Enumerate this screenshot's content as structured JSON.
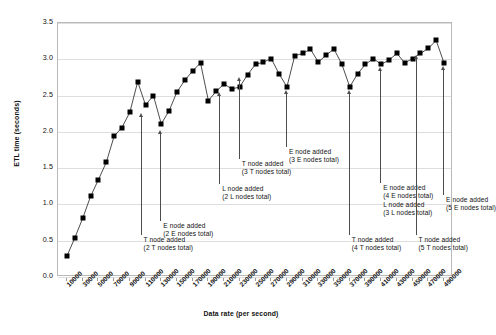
{
  "chart_data": {
    "type": "line",
    "title": "",
    "xlabel": "Data rate (per second)",
    "ylabel": "ETL time (seconds)",
    "ylim": [
      0.0,
      3.5
    ],
    "ytick_labels": [
      "0.0",
      "0.5",
      "1.0",
      "1.5",
      "2.0",
      "2.5",
      "3.0",
      "3.5"
    ],
    "ytick_values": [
      0.0,
      0.5,
      1.0,
      1.5,
      2.0,
      2.5,
      3.0,
      3.5
    ],
    "grid": true,
    "legend": "none",
    "marker": "filled-square",
    "categories": [
      "10000",
      "30000",
      "50000",
      "70000",
      "90000",
      "110000",
      "130000",
      "150000",
      "170000",
      "190000",
      "210000",
      "230000",
      "250000",
      "270000",
      "290000",
      "310000",
      "330000",
      "350000",
      "370000",
      "390000",
      "410000",
      "430000",
      "450000",
      "470000",
      "490000"
    ],
    "xtick_labels": [
      "10000",
      "30000",
      "50000",
      "70000",
      "90000",
      "110000",
      "130000",
      "150000",
      "170000",
      "190000",
      "210000",
      "230000",
      "250000",
      "270000",
      "290000",
      "310000",
      "330000",
      "350000",
      "370000",
      "390000",
      "410000",
      "430000",
      "450000",
      "470000",
      "490000"
    ],
    "values": [
      0.29,
      0.54,
      0.81,
      1.11,
      1.34,
      1.58,
      1.94,
      2.06,
      2.27,
      2.69,
      2.37,
      2.5,
      2.11,
      2.29,
      2.55,
      2.71,
      2.84,
      2.95,
      2.43,
      2.56,
      2.66,
      2.59,
      2.62,
      2.79,
      2.93
    ],
    "series": [
      {
        "name": "ETL time",
        "values": [
          0.29,
          0.54,
          0.81,
          1.11,
          1.34,
          1.58,
          1.94,
          2.06,
          2.27,
          2.69,
          2.37,
          2.5,
          2.11,
          2.29,
          2.55,
          2.71,
          2.84,
          2.95,
          2.43,
          2.56,
          2.66,
          2.59,
          2.62,
          2.79,
          2.93
        ]
      }
    ],
    "points": [
      {
        "x": "10000",
        "y": 0.29
      },
      {
        "x": "20000",
        "y": 0.54
      },
      {
        "x": "30000",
        "y": 0.81
      },
      {
        "x": "40000",
        "y": 1.11
      },
      {
        "x": "50000",
        "y": 1.34
      },
      {
        "x": "60000",
        "y": 1.58
      },
      {
        "x": "70000",
        "y": 1.94
      },
      {
        "x": "80000",
        "y": 2.06
      },
      {
        "x": "90000",
        "y": 2.27
      },
      {
        "x": "100000",
        "y": 2.69
      },
      {
        "x": "110000",
        "y": 2.37
      },
      {
        "x": "120000",
        "y": 2.5
      },
      {
        "x": "130000",
        "y": 2.11
      },
      {
        "x": "140000",
        "y": 2.29
      },
      {
        "x": "150000",
        "y": 2.55
      },
      {
        "x": "160000",
        "y": 2.71
      },
      {
        "x": "170000",
        "y": 2.84
      },
      {
        "x": "180000",
        "y": 2.95
      },
      {
        "x": "190000",
        "y": 2.43
      },
      {
        "x": "200000",
        "y": 2.56
      },
      {
        "x": "210000",
        "y": 2.66
      },
      {
        "x": "220000",
        "y": 2.59
      },
      {
        "x": "230000",
        "y": 2.62
      },
      {
        "x": "240000",
        "y": 2.79
      },
      {
        "x": "250000",
        "y": 2.93
      },
      {
        "x": "260000",
        "y": 2.96
      },
      {
        "x": "270000",
        "y": 3.01
      },
      {
        "x": "280000",
        "y": 2.8
      },
      {
        "x": "290000",
        "y": 2.62
      },
      {
        "x": "300000",
        "y": 3.05
      },
      {
        "x": "310000",
        "y": 3.08
      },
      {
        "x": "320000",
        "y": 3.14
      },
      {
        "x": "330000",
        "y": 2.96
      },
      {
        "x": "340000",
        "y": 3.06
      },
      {
        "x": "350000",
        "y": 3.14
      },
      {
        "x": "360000",
        "y": 2.93
      },
      {
        "x": "370000",
        "y": 2.62
      },
      {
        "x": "380000",
        "y": 2.8
      },
      {
        "x": "390000",
        "y": 2.93
      },
      {
        "x": "400000",
        "y": 3.01
      },
      {
        "x": "410000",
        "y": 2.93
      },
      {
        "x": "420000",
        "y": 2.99
      },
      {
        "x": "430000",
        "y": 3.08
      },
      {
        "x": "440000",
        "y": 2.95
      },
      {
        "x": "450000",
        "y": 3.01
      },
      {
        "x": "460000",
        "y": 3.08
      },
      {
        "x": "470000",
        "y": 3.15
      },
      {
        "x": "480000",
        "y": 3.26
      },
      {
        "x": "490000",
        "y": 2.95
      }
    ],
    "annotations": [
      {
        "id": "t-node-2",
        "lines": [
          "T node added",
          "(2 T nodes total)"
        ],
        "x_value": "105000",
        "point_y": 2.24
      },
      {
        "id": "e-node-2",
        "lines": [
          "E node added",
          "(2 E nodes total)"
        ],
        "x_value": "130000",
        "point_y": 2.01
      },
      {
        "id": "l-node-2",
        "lines": [
          "L node added",
          "(2 L nodes total)"
        ],
        "x_value": "205000",
        "point_y": 2.53
      },
      {
        "id": "t-node-3",
        "lines": [
          "T node added",
          "(3 T nodes total)"
        ],
        "x_value": "230000",
        "point_y": 2.74
      },
      {
        "id": "e-node-3",
        "lines": [
          "E node added",
          "(3 E nodes total)"
        ],
        "x_value": "290000",
        "point_y": 2.56
      },
      {
        "id": "t-node-4",
        "lines": [
          "T node added",
          "(4 T nodes total)"
        ],
        "x_value": "370000",
        "point_y": 2.56
      },
      {
        "id": "e-node-4-l-node-3",
        "lines": [
          "E node added",
          "(4 E nodes total)",
          "L node added",
          "(3 L nodes total)"
        ],
        "x_value": "410000",
        "point_y": 2.88
      },
      {
        "id": "t-node-5",
        "lines": [
          "T node added",
          "(5 T nodes total)"
        ],
        "x_value": "455000",
        "point_y": 3.05
      },
      {
        "id": "e-node-5",
        "lines": [
          "E node added",
          "(5 E nodes total)"
        ],
        "x_value": "490000",
        "point_y": 2.9
      }
    ],
    "colors": {
      "series": "#000000",
      "grid": "#dedede",
      "frame": "#b9b9b9",
      "annotation": "#4d4d4d",
      "text": "#111111",
      "background": "#ffffff"
    }
  }
}
